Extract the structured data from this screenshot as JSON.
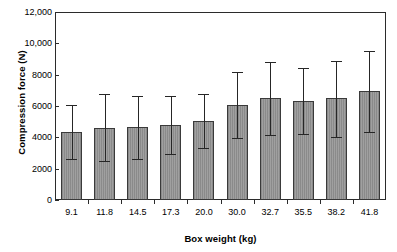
{
  "chart_data": {
    "type": "bar",
    "title": "",
    "xlabel": "Box weight (kg)",
    "ylabel": "Compression force (N)",
    "categories": [
      "9.1",
      "11.8",
      "14.5",
      "17.3",
      "20.0",
      "30.0",
      "32.7",
      "35.5",
      "38.2",
      "41.8"
    ],
    "values": [
      4330,
      4620,
      4660,
      4800,
      5060,
      6060,
      6480,
      6300,
      6480,
      6930
    ],
    "error_upper": [
      6050,
      6760,
      6650,
      6650,
      6790,
      8180,
      8780,
      8450,
      8890,
      9540
    ],
    "error_lower": [
      2600,
      2470,
      2620,
      2920,
      3290,
      3930,
      4180,
      4200,
      4050,
      4360
    ],
    "ylim": [
      0,
      12000
    ],
    "ytick_values": [
      0,
      2000,
      4000,
      6000,
      8000,
      10000,
      12000
    ],
    "ytick_labels": [
      "0",
      "2000",
      "4000",
      "6000",
      "8000",
      "10,000",
      "12,000"
    ],
    "grid": false,
    "legend": null,
    "bar_color": "#9a9a9a",
    "bar_edge_color": "#3a3a3a",
    "error_color": "#262626",
    "axis_color": "#2b2b2b",
    "background": "#ffffff"
  }
}
